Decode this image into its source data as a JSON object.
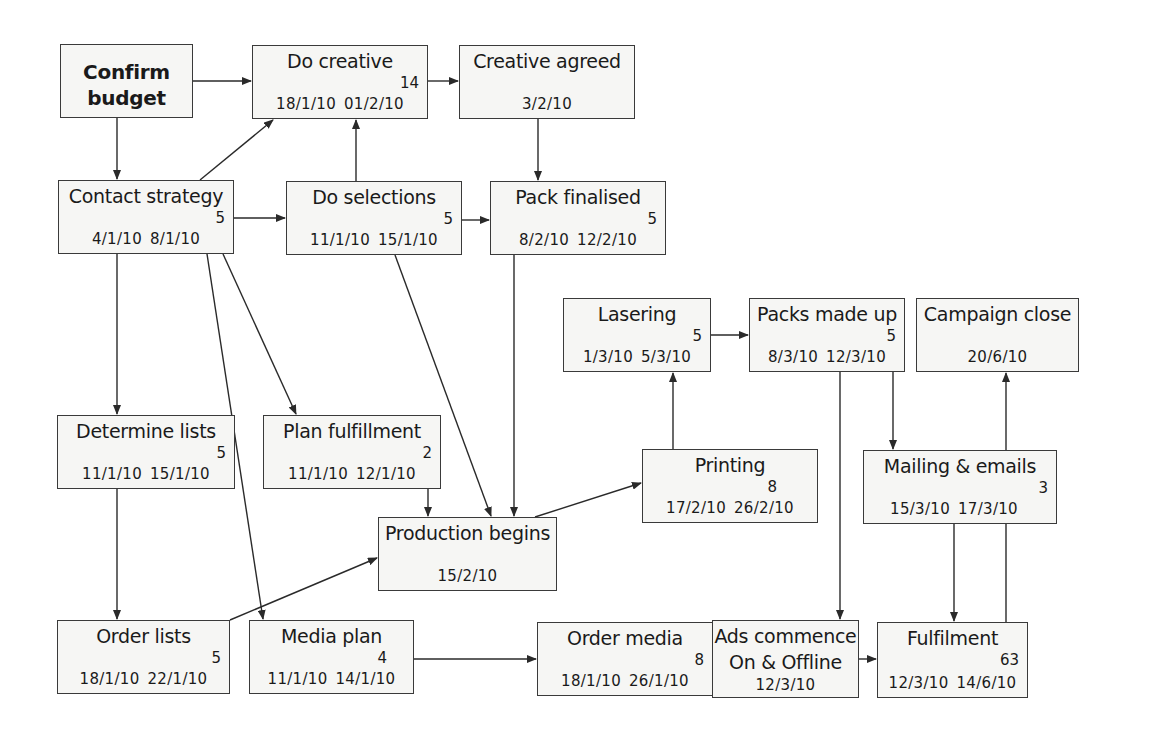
{
  "diagram": {
    "type": "critical-path network / PERT chart",
    "nodes": [
      {
        "id": "confirm_budget",
        "title": "Confirm budget",
        "title_lines": [
          "Confirm",
          "budget"
        ],
        "bold": true,
        "x": 60,
        "y": 44,
        "w": 133,
        "h": 74
      },
      {
        "id": "do_creative",
        "title": "Do creative",
        "duration": "14",
        "start": "18/1/10",
        "end": "01/2/10",
        "x": 252,
        "y": 45,
        "w": 176,
        "h": 74
      },
      {
        "id": "creative_agreed",
        "title": "Creative agreed",
        "date": "3/2/10",
        "x": 459,
        "y": 45,
        "w": 176,
        "h": 74
      },
      {
        "id": "contact_strategy",
        "title": "Contact strategy",
        "duration": "5",
        "start": "4/1/10",
        "end": "8/1/10",
        "x": 58,
        "y": 180,
        "w": 176,
        "h": 74
      },
      {
        "id": "do_selections",
        "title": "Do selections",
        "duration": "5",
        "start": "11/1/10",
        "end": "15/1/10",
        "x": 286,
        "y": 181,
        "w": 176,
        "h": 74
      },
      {
        "id": "pack_finalised",
        "title": "Pack finalised",
        "duration": "5",
        "start": "8/2/10",
        "end": "12/2/10",
        "x": 490,
        "y": 181,
        "w": 176,
        "h": 74
      },
      {
        "id": "lasering",
        "title": "Lasering",
        "duration": "5",
        "start": "1/3/10",
        "end": "5/3/10",
        "x": 563,
        "y": 298,
        "w": 148,
        "h": 74
      },
      {
        "id": "packs_made_up",
        "title": "Packs made up",
        "duration": "5",
        "start": "8/3/10",
        "end": "12/3/10",
        "x": 749,
        "y": 298,
        "w": 156,
        "h": 74
      },
      {
        "id": "campaign_close",
        "title": "Campaign close",
        "date": "20/6/10",
        "x": 916,
        "y": 298,
        "w": 163,
        "h": 74
      },
      {
        "id": "determine_lists",
        "title": "Determine lists",
        "duration": "5",
        "start": "11/1/10",
        "end": "15/1/10",
        "x": 57,
        "y": 415,
        "w": 178,
        "h": 74
      },
      {
        "id": "plan_fulfillment",
        "title": "Plan fulfillment",
        "duration": "2",
        "start": "11/1/10",
        "end": "12/1/10",
        "x": 263,
        "y": 415,
        "w": 178,
        "h": 74
      },
      {
        "id": "printing",
        "title": "Printing",
        "duration": "8",
        "start": "17/2/10",
        "end": "26/2/10",
        "x": 642,
        "y": 449,
        "w": 176,
        "h": 74
      },
      {
        "id": "mailing_emails",
        "title": "Mailing & emails",
        "duration": "3",
        "start": "15/3/10",
        "end": "17/3/10",
        "x": 863,
        "y": 450,
        "w": 194,
        "h": 74
      },
      {
        "id": "production_begins",
        "title": "Production begins",
        "date": "15/2/10",
        "x": 378,
        "y": 517,
        "w": 179,
        "h": 74
      },
      {
        "id": "order_lists",
        "title": "Order lists",
        "duration": "5",
        "start": "18/1/10",
        "end": "22/1/10",
        "x": 57,
        "y": 620,
        "w": 173,
        "h": 74
      },
      {
        "id": "media_plan",
        "title": "Media plan",
        "duration": "4",
        "start": "11/1/10",
        "end": "14/1/10",
        "x": 249,
        "y": 620,
        "w": 165,
        "h": 74
      },
      {
        "id": "order_media",
        "title": "Order media",
        "duration": "8",
        "start": "18/1/10",
        "end": "26/1/10",
        "x": 537,
        "y": 622,
        "w": 176,
        "h": 74
      },
      {
        "id": "ads_commence",
        "title": "Ads commence On & Offline",
        "title_lines": [
          "Ads commence",
          "On & Offline"
        ],
        "date": "12/3/10",
        "x": 712,
        "y": 620,
        "w": 147,
        "h": 78
      },
      {
        "id": "fulfilment",
        "title": "Fulfilment",
        "duration": "63",
        "start": "12/3/10",
        "end": "14/6/10",
        "x": 877,
        "y": 622,
        "w": 151,
        "h": 76
      }
    ],
    "edges": [
      {
        "from": "confirm_budget",
        "to": "do_creative"
      },
      {
        "from": "confirm_budget",
        "to": "contact_strategy"
      },
      {
        "from": "do_creative",
        "to": "creative_agreed"
      },
      {
        "from": "contact_strategy",
        "to": "do_creative"
      },
      {
        "from": "do_selections",
        "to": "do_creative"
      },
      {
        "from": "creative_agreed",
        "to": "pack_finalised"
      },
      {
        "from": "contact_strategy",
        "to": "do_selections"
      },
      {
        "from": "do_selections",
        "to": "pack_finalised"
      },
      {
        "from": "contact_strategy",
        "to": "determine_lists"
      },
      {
        "from": "contact_strategy",
        "to": "plan_fulfillment"
      },
      {
        "from": "contact_strategy",
        "to": "media_plan"
      },
      {
        "from": "do_selections",
        "to": "production_begins"
      },
      {
        "from": "pack_finalised",
        "to": "production_begins"
      },
      {
        "from": "plan_fulfillment",
        "to": "production_begins"
      },
      {
        "from": "determine_lists",
        "to": "order_lists"
      },
      {
        "from": "order_lists",
        "to": "production_begins"
      },
      {
        "from": "production_begins",
        "to": "printing"
      },
      {
        "from": "printing",
        "to": "lasering"
      },
      {
        "from": "lasering",
        "to": "packs_made_up"
      },
      {
        "from": "packs_made_up",
        "to": "mailing_emails"
      },
      {
        "from": "packs_made_up",
        "to": "ads_commence"
      },
      {
        "from": "media_plan",
        "to": "order_media"
      },
      {
        "from": "order_media",
        "to": "ads_commence"
      },
      {
        "from": "ads_commence",
        "to": "fulfilment"
      },
      {
        "from": "mailing_emails",
        "to": "fulfilment"
      },
      {
        "from": "fulfilment",
        "to": "campaign_close"
      }
    ],
    "colors": {
      "line": "#2a2a2a",
      "box_border": "#3a3a3a",
      "box_fill": "#f6f6f4",
      "background": "#ffffff"
    }
  }
}
